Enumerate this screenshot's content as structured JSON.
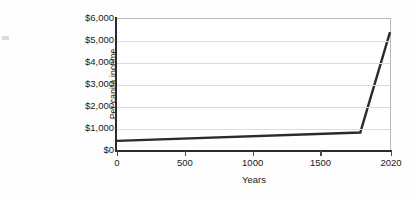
{
  "chart_data": {
    "type": "line",
    "title": "",
    "xlabel": "Years",
    "ylabel_line_1": "Per capita income",
    "ylabel_line_2": "(in 1990 international dollars)",
    "xlim": [
      0,
      2020
    ],
    "ylim": [
      0,
      6000
    ],
    "grid": true,
    "legend": "none",
    "x_ticks": [
      {
        "value": 0,
        "label": "0"
      },
      {
        "value": 500,
        "label": "500"
      },
      {
        "value": 1000,
        "label": "1000"
      },
      {
        "value": 1500,
        "label": "1500"
      },
      {
        "value": 2020,
        "label": "2020"
      }
    ],
    "y_ticks": [
      {
        "value": 0,
        "label": "$0"
      },
      {
        "value": 1000,
        "label": "$1,000"
      },
      {
        "value": 2000,
        "label": "$2,000"
      },
      {
        "value": 3000,
        "label": "$3,000"
      },
      {
        "value": 4000,
        "label": "$4,000"
      },
      {
        "value": 5000,
        "label": "$5,000"
      },
      {
        "value": 6000,
        "label": "$6,000"
      }
    ],
    "series": [
      {
        "name": "Per capita income",
        "color": "#2b2b2b",
        "x": [
          0,
          1800,
          2020
        ],
        "values": [
          420,
          800,
          5400
        ]
      }
    ]
  }
}
